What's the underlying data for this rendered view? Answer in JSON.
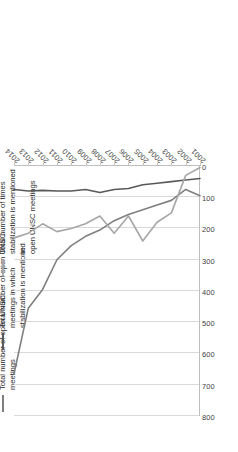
{
  "chart_data": {
    "type": "line",
    "title": "",
    "xlabel": "",
    "ylabel": "",
    "categories": [
      "2001",
      "2002",
      "2003",
      "2004",
      "2005",
      "2006",
      "2007",
      "2008",
      "2009",
      "2010",
      "2011",
      "2012",
      "2013",
      "2014"
    ],
    "x": [
      "2001",
      "2002",
      "2003",
      "2004",
      "2005",
      "2006",
      "2007",
      "2008",
      "2009",
      "2010",
      "2011",
      "2012",
      "2013",
      "2014"
    ],
    "ylim": [
      0,
      800
    ],
    "y_ticks": [
      0,
      100,
      200,
      300,
      400,
      500,
      600,
      700,
      800
    ],
    "tick_labels": [
      "800",
      "700",
      "600",
      "500",
      "400",
      "300",
      "200",
      "100",
      "0"
    ],
    "grid": true,
    "grid_axis": "value",
    "legend_position": "top",
    "orientation": "rotated-90-ccw",
    "series": [
      {
        "name": "Total number of open UNSC meetings",
        "color": "#7f7f7f",
        "values": [
          95,
          75,
          110,
          125,
          140,
          155,
          175,
          205,
          225,
          255,
          300,
          395,
          455,
          665
        ]
      },
      {
        "name": "Total number of open UNSC meetings in which stabilization is mentioned",
        "color": "#595959",
        "values": [
          40,
          45,
          50,
          55,
          60,
          72,
          75,
          85,
          75,
          80,
          80,
          78,
          80,
          75
        ]
      },
      {
        "name": "Total number of times stabilization is mentioned in open UNSC meetings",
        "color": "#a6a6a6",
        "values": [
          5,
          30,
          150,
          180,
          240,
          160,
          215,
          160,
          185,
          200,
          210,
          185,
          215,
          230
        ]
      }
    ]
  },
  "legend": {
    "items": [
      {
        "label": "Total number of open UNSC\nmeetings",
        "color": "#7f7f7f"
      },
      {
        "label": "Total number of open UNSC\nmeetings in which\nstabilization is mentioned",
        "color": "#595959"
      },
      {
        "label": "Total number of times\nstabilization is mentioned in\nopen UNSC meetings",
        "color": "#a6a6a6"
      }
    ]
  },
  "axes": {
    "value_tick_labels": [
      "800",
      "700",
      "600",
      "500",
      "400",
      "300",
      "200",
      "100",
      "0"
    ],
    "category_tick_labels": [
      "2001",
      "2002",
      "2003",
      "2004",
      "2005",
      "2006",
      "2007",
      "2008",
      "2009",
      "2010",
      "2011",
      "2012",
      "2013",
      "2014"
    ]
  },
  "colors": {
    "grid": "#d9d9d9",
    "axis": "#bfbfbf",
    "text": "#3f3f3f",
    "background": "#ffffff"
  }
}
